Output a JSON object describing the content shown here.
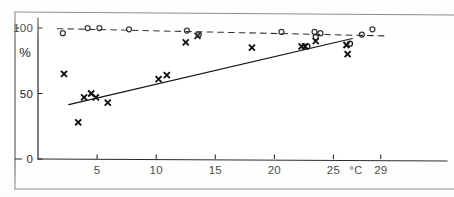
{
  "figure": {
    "background_color": "#ffffff",
    "ink_color": "#1b1b1b",
    "frame": {
      "top_rule": true,
      "bottom_rule": true,
      "left_rule": true
    }
  },
  "chart_data": {
    "type": "scatter",
    "title": "",
    "subtitle": "",
    "xlabel": "°C",
    "ylabel": "%",
    "xlim": [
      0,
      30.2
    ],
    "ylim": [
      0,
      118
    ],
    "grid": false,
    "legend": "none",
    "x_ticks": [
      5,
      10,
      15,
      20,
      25,
      29
    ],
    "x_tick_labels": [
      "5",
      "10",
      "15",
      "20",
      "25",
      "29"
    ],
    "y_ticks": [
      0,
      50,
      100
    ],
    "y_tick_labels": [
      "0",
      "50",
      "100"
    ],
    "x_unit_label": "°C",
    "y_axis_label": "%",
    "series": [
      {
        "name": "open-circle-series",
        "marker": "circle",
        "marker_label": "o",
        "color": "#141414",
        "points": [
          {
            "x": 2.1,
            "y": 96
          },
          {
            "x": 4.2,
            "y": 100
          },
          {
            "x": 5.2,
            "y": 100
          },
          {
            "x": 7.7,
            "y": 99
          },
          {
            "x": 12.6,
            "y": 98
          },
          {
            "x": 13.6,
            "y": 95
          },
          {
            "x": 20.6,
            "y": 97
          },
          {
            "x": 23.4,
            "y": 97
          },
          {
            "x": 23.5,
            "y": 93
          },
          {
            "x": 23.9,
            "y": 96
          },
          {
            "x": 26.4,
            "y": 88
          },
          {
            "x": 27.4,
            "y": 95
          },
          {
            "x": 28.3,
            "y": 99
          },
          {
            "x": 22.8,
            "y": 86
          }
        ],
        "fit_line": {
          "style": "dashed",
          "x_start": 1.6,
          "y_start": 99.5,
          "x_end": 29.3,
          "y_end": 94.0
        }
      },
      {
        "name": "cross-series",
        "marker": "cross",
        "marker_label": "x",
        "color": "#101010",
        "points": [
          {
            "x": 2.2,
            "y": 65
          },
          {
            "x": 3.4,
            "y": 28
          },
          {
            "x": 3.9,
            "y": 47
          },
          {
            "x": 4.5,
            "y": 50
          },
          {
            "x": 4.9,
            "y": 47
          },
          {
            "x": 5.9,
            "y": 43
          },
          {
            "x": 10.2,
            "y": 61
          },
          {
            "x": 10.9,
            "y": 64
          },
          {
            "x": 12.5,
            "y": 89
          },
          {
            "x": 13.5,
            "y": 94
          },
          {
            "x": 18.1,
            "y": 85
          },
          {
            "x": 22.3,
            "y": 86
          },
          {
            "x": 22.6,
            "y": 86
          },
          {
            "x": 23.5,
            "y": 90
          },
          {
            "x": 26.1,
            "y": 87
          },
          {
            "x": 26.2,
            "y": 80
          }
        ],
        "fit_line": {
          "style": "solid",
          "x_start": 2.6,
          "y_start": 41.5,
          "x_end": 26.6,
          "y_end": 92.0
        }
      }
    ]
  }
}
